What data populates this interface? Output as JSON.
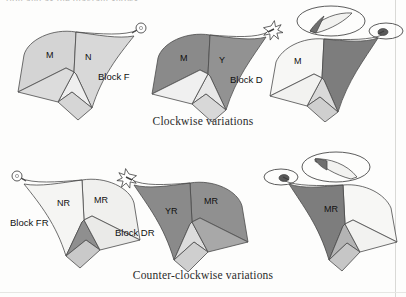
{
  "figure": {
    "clipped_heading": "tion and as the diagram shows",
    "background_color": "#fdfdfc",
    "outline_color": "#4a4a4a"
  },
  "captions": {
    "clockwise": "Clockwise variations",
    "counter_clockwise": "Counter-clockwise variations"
  },
  "palette": {
    "light_gray": "#d4d4d4",
    "pale_gray": "#e3e3e3",
    "near_white": "#f7f7f5",
    "mid_gray": "#9a9a9a",
    "dark_gray": "#8a8a8a",
    "darker_gray": "#6f6f6f",
    "marker_dark": "#4c4c4c"
  },
  "rows": [
    {
      "name": "clockwise",
      "caption": "Clockwise variations",
      "blocks": [
        {
          "id": "block-f",
          "name": "Block F",
          "label": "Block F",
          "panels": [
            {
              "key": "M",
              "label": "M",
              "fill": "#d4d4d4"
            },
            {
              "key": "N",
              "label": "N",
              "fill": "#d8d8d8"
            }
          ],
          "marker": "circle",
          "marker_side": "right",
          "mirrored": false,
          "callout": false
        },
        {
          "id": "block-d",
          "name": "Block D",
          "label": "Block D",
          "panels": [
            {
              "key": "M",
              "label": "M",
              "fill": "#8a8a8a"
            },
            {
              "key": "Y",
              "label": "Y",
              "fill": "#929292"
            }
          ],
          "marker": "star",
          "marker_side": "right",
          "mirrored": false,
          "callout": false
        },
        {
          "id": "block-clockwise-detail",
          "name": "Clockwise detail block",
          "label": "",
          "panels": [
            {
              "key": "M",
              "label": "M",
              "fill": "#f7f7f5"
            },
            {
              "key": "shade",
              "label": "",
              "fill": "#7d7d7d"
            }
          ],
          "marker": "dot",
          "marker_side": "right",
          "mirrored": false,
          "callout": true
        }
      ]
    },
    {
      "name": "counter-clockwise",
      "caption": "Counter-clockwise variations",
      "blocks": [
        {
          "id": "block-fr",
          "name": "Block FR",
          "label": "Block FR",
          "panels": [
            {
              "key": "NR",
              "label": "NR",
              "fill": "#f5f5f3"
            },
            {
              "key": "MR",
              "label": "MR",
              "fill": "#f0f0ee"
            }
          ],
          "marker": "circle",
          "marker_side": "left",
          "mirrored": true,
          "callout": false
        },
        {
          "id": "block-dr",
          "name": "Block DR",
          "label": "Block DR",
          "panels": [
            {
              "key": "YR",
              "label": "YR",
              "fill": "#8a8a8a"
            },
            {
              "key": "MR",
              "label": "MR",
              "fill": "#909090"
            }
          ],
          "marker": "star",
          "marker_side": "left",
          "mirrored": true,
          "callout": false
        },
        {
          "id": "block-counter-detail",
          "name": "Counter-clockwise detail block",
          "label": "",
          "panels": [
            {
              "key": "MR",
              "label": "MR",
              "fill": "#f7f7f5"
            },
            {
              "key": "shade",
              "label": "",
              "fill": "#7d7d7d"
            }
          ],
          "marker": "dot",
          "marker_side": "left",
          "mirrored": true,
          "callout": true
        }
      ]
    }
  ]
}
